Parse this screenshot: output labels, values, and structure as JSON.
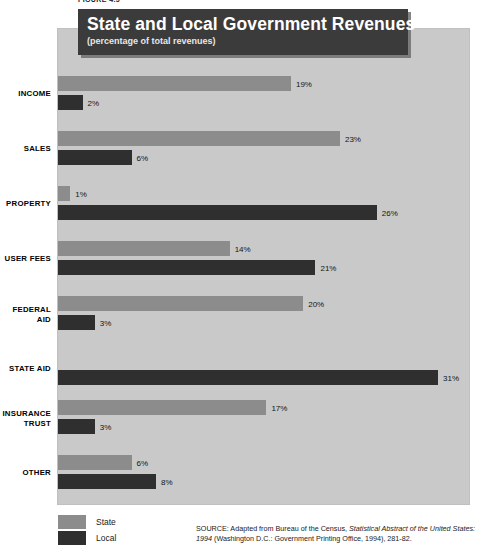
{
  "figure_number": "FIGURE 4.5",
  "title": {
    "main": "State and Local Government Revenues",
    "sub": "(percentage of total revenues)"
  },
  "legend": {
    "position": "bottom-left",
    "items": [
      {
        "label": "State",
        "color": "#8c8c8c",
        "swatch": "state-swatch"
      },
      {
        "label": "Local",
        "color": "#2f2f2f",
        "swatch": "local-swatch"
      }
    ]
  },
  "source": {
    "prefix": "SOURCE:  Adapted from Bureau of the Census, ",
    "italic": "Statistical Abstract of the United States: 1994",
    "suffix": " (Washington D.C.: Government Printing Office, 1994), 281-82."
  },
  "colors": {
    "panel_background": "#c9c9c9",
    "title_banner": "#3b3b3b",
    "state_bar": "#8c8c8c",
    "local_bar": "#2f2f2f",
    "page_background": "#ffffff"
  },
  "chart_data": {
    "type": "bar",
    "orientation": "horizontal",
    "title": "State and Local Government Revenues",
    "subtitle": "(percentage of total revenues)",
    "xlabel": "",
    "ylabel": "",
    "xlim": [
      0,
      33
    ],
    "grid": false,
    "value_suffix": "%",
    "legend_position": "bottom-left",
    "categories": [
      "INCOME",
      "SALES",
      "PROPERTY",
      "USER FEES",
      "FEDERAL AID",
      "STATE AID",
      "INSURANCE TRUST",
      "OTHER"
    ],
    "series": [
      {
        "name": "State",
        "color": "#8c8c8c",
        "values": [
          19,
          23,
          1,
          14,
          20,
          null,
          17,
          6
        ],
        "labels": [
          "19%",
          "23%",
          "1%",
          "14%",
          "20%",
          "",
          "17%",
          "6%"
        ]
      },
      {
        "name": "Local",
        "color": "#2f2f2f",
        "values": [
          2,
          6,
          26,
          21,
          3,
          31,
          3,
          8
        ],
        "labels": [
          "2%",
          "6%",
          "26%",
          "21%",
          "3%",
          "31%",
          "3%",
          "8%"
        ]
      }
    ],
    "rows": [
      {
        "label": "INCOME",
        "label_lines": [
          "INCOME"
        ],
        "state": 19,
        "state_label": "19%",
        "local": 2,
        "local_label": "2%"
      },
      {
        "label": "SALES",
        "label_lines": [
          "SALES"
        ],
        "state": 23,
        "state_label": "23%",
        "local": 6,
        "local_label": "6%"
      },
      {
        "label": "PROPERTY",
        "label_lines": [
          "PROPERTY"
        ],
        "state": 1,
        "state_label": "1%",
        "local": 26,
        "local_label": "26%"
      },
      {
        "label": "USER FEES",
        "label_lines": [
          "USER FEES"
        ],
        "state": 14,
        "state_label": "14%",
        "local": 21,
        "local_label": "21%"
      },
      {
        "label": "FEDERAL AID",
        "label_lines": [
          "FEDERAL",
          "AID"
        ],
        "state": 20,
        "state_label": "20%",
        "local": 3,
        "local_label": "3%"
      },
      {
        "label": "STATE AID",
        "label_lines": [
          "STATE AID"
        ],
        "state": null,
        "state_label": "",
        "local": 31,
        "local_label": "31%"
      },
      {
        "label": "INSURANCE TRUST",
        "label_lines": [
          "INSURANCE",
          "TRUST"
        ],
        "state": 17,
        "state_label": "17%",
        "local": 3,
        "local_label": "3%"
      },
      {
        "label": "OTHER",
        "label_lines": [
          "OTHER"
        ],
        "state": 6,
        "state_label": "6%",
        "local": 8,
        "local_label": "8%"
      }
    ]
  }
}
